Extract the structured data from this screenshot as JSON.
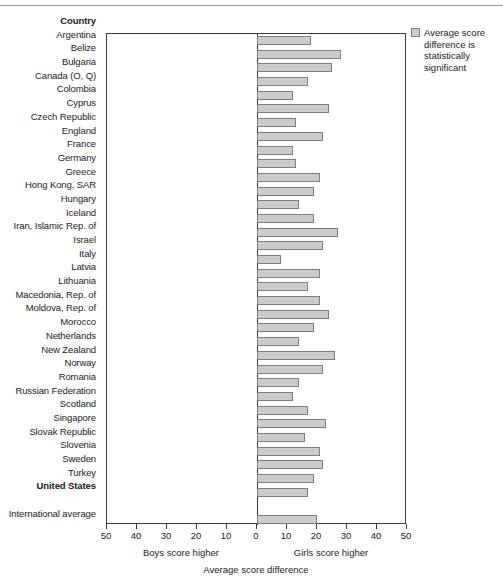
{
  "chart_data": {
    "type": "bar",
    "title": "",
    "xlabel": "Average score difference",
    "ylabel": "Country",
    "xlim": [
      -50,
      50
    ],
    "xticks": [
      50,
      40,
      30,
      20,
      10,
      0,
      10,
      20,
      30,
      40,
      50
    ],
    "grid": false,
    "orientation": "horizontal",
    "left_axis_caption": "Boys score higher",
    "right_axis_caption": "Girls score higher",
    "legend": {
      "position": "top-right",
      "entries": [
        {
          "label": "Average score difference is statistically significant",
          "color": "#cccccc"
        }
      ]
    },
    "categories": [
      "Argentina",
      "Belize",
      "Bulgaria",
      "Canada (O, Q)",
      "Colombia",
      "Cyprus",
      "Czech Republic",
      "England",
      "France",
      "Germany",
      "Greece",
      "Hong Kong, SAR",
      "Hungary",
      "Iceland",
      "Iran, Islamic Rep. of",
      "Israel",
      "Italy",
      "Latvia",
      "Lithuania",
      "Macedonia, Rep. of",
      "Moldova, Rep. of",
      "Morocco",
      "Netherlands",
      "New Zealand",
      "Norway",
      "Romania",
      "Russian Federation",
      "Scotland",
      "Singapore",
      "Slovak Republic",
      "Slovenia",
      "Sweden",
      "Turkey",
      "United States"
    ],
    "values": [
      18,
      28,
      25,
      17,
      12,
      24,
      13,
      22,
      12,
      13,
      21,
      19,
      14,
      19,
      27,
      22,
      8,
      21,
      17,
      21,
      24,
      19,
      14,
      26,
      22,
      14,
      12,
      17,
      23,
      16,
      21,
      22,
      19,
      17
    ],
    "summary_row": {
      "label": "International average",
      "value": 20
    }
  },
  "header": {
    "country_column": "Country"
  },
  "legend": {
    "swatch_name": "legend-swatch",
    "text": "Average score difference is statistically significant"
  },
  "axis": {
    "boys": "Boys score higher",
    "girls": "Girls score higher",
    "title": "Average score difference"
  }
}
